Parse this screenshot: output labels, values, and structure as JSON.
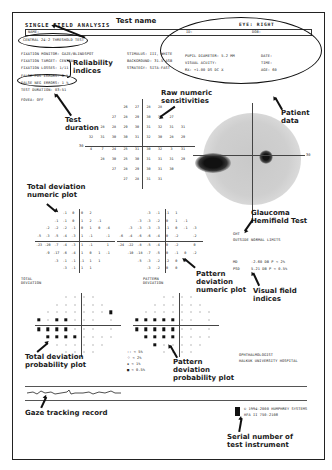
{
  "report": {
    "title": "SINGLE FIELD ANALYSIS",
    "name_label": "NAME:",
    "eye": "EYE: RIGHT",
    "id_label": "ID:",
    "dob_label": "DOB:",
    "test_name": "CENTRAL 24-2 THRESHOLD TEST",
    "left_params": [
      "FIXATION MONITOR: GAZE/BLINDSPOT",
      "FIXATION TARGET: CENTRAL",
      "FIXATION LOSSES: 1/11",
      "FALSE POS ERRORS: 0 %",
      "FALSE NEG ERRORS: 1 %",
      "TEST DURATION: 03:51",
      "FOVEA: OFF"
    ],
    "mid_params": [
      "STIMULUS: III, WHITE",
      "BACKGROUND: 31.5 ASB",
      "STRATEGY: SITA-FAST"
    ],
    "right_params": [
      "PUPIL DIAMETER: 5.2 MM",
      "VISUAL ACUITY:",
      "RX: +1.00 DS   DC X"
    ],
    "right_params2": [
      "DATE:",
      "TIME:",
      "AGE: 60"
    ],
    "ght_title": "GHT",
    "ght_value": "OUTSIDE NORMAL LIMITS",
    "md_label": "MD",
    "md_value": "-2.60 DB  P < 2%",
    "psd_label": "PSD",
    "psd_value": "5.21 DB  P < 0.5%",
    "total_dev_title": [
      "TOTAL",
      "DEVIATION"
    ],
    "pattern_dev_title": [
      "PATTERN",
      "DEVIATION"
    ],
    "legend": [
      {
        "symbol": "::",
        "text": "< 5%"
      },
      {
        "symbol": "⁘",
        "text": "< 2%"
      },
      {
        "symbol": "▪",
        "text": "< 1%"
      },
      {
        "symbol": "■",
        "text": "< 0.5%"
      }
    ],
    "physician": "OPHTHALMOLOGIST",
    "hospital": "HALKUK UNIVERSITY HOSPITAL",
    "instrument_line1": "© 1994-2000 HUMPHREY SYSTEMS",
    "instrument_line2": "HFA II 750-2108",
    "threshold_30_label": "30",
    "greyscale_30_label": "30"
  },
  "raw_sensitivities": [
    [
      "",
      "",
      "",
      "26",
      "27",
      "28",
      "28",
      "",
      "",
      ""
    ],
    [
      "",
      "",
      "27",
      "28",
      "29",
      "30",
      "30",
      "27",
      "",
      ""
    ],
    [
      "",
      "28",
      "28",
      "29",
      "30",
      "31",
      "32",
      "31",
      "31",
      ""
    ],
    [
      "32",
      "31",
      "30",
      "30",
      "31",
      "32",
      "30",
      "28",
      "29",
      ""
    ],
    [
      "4",
      "7",
      "24",
      "25",
      "31",
      "30",
      "32",
      "3",
      "31",
      ""
    ],
    [
      "",
      "28",
      "30",
      "25",
      "30",
      "31",
      "31",
      "31",
      "29",
      ""
    ],
    [
      "",
      "",
      "27",
      "28",
      "29",
      "30",
      "31",
      "30",
      "",
      ""
    ],
    [
      "",
      "",
      "",
      "27",
      "28",
      "31",
      "31",
      "",
      "",
      ""
    ]
  ],
  "total_deviation": [
    [
      "",
      "",
      "",
      "-1",
      "0",
      "0",
      "2",
      "",
      "",
      ""
    ],
    [
      "",
      "",
      "-1",
      "-1",
      "0",
      "1",
      "2",
      "-1",
      "",
      ""
    ],
    [
      "",
      "-2",
      "-2",
      "-2",
      "-1",
      "0",
      "1",
      "0",
      "-4",
      ""
    ],
    [
      "-5",
      "-3",
      "-5",
      "-4",
      "-3",
      "1",
      "-1",
      "",
      "-1",
      ""
    ],
    [
      "-23",
      "-20",
      "-7",
      "-4",
      "-3",
      "1",
      "-1",
      "",
      "1",
      ""
    ],
    [
      "",
      "-9",
      "-17",
      "-6",
      "-4",
      "1",
      "0",
      "1",
      "-1",
      ""
    ],
    [
      "",
      "",
      "-3",
      "-1",
      "-1",
      "-1",
      "1",
      "1",
      "",
      ""
    ],
    [
      "",
      "",
      "",
      "-3",
      "-1",
      "1",
      "1",
      "",
      "",
      ""
    ]
  ],
  "pattern_deviation": [
    [
      "",
      "",
      "",
      "-3",
      "-1",
      "-1",
      "1",
      "",
      "",
      ""
    ],
    [
      "",
      "",
      "-3",
      "-3",
      "-2",
      "0",
      "1",
      "-1",
      "",
      ""
    ],
    [
      "",
      "-3",
      "-3",
      "-3",
      "-3",
      "-1",
      "0",
      "-1",
      "-3",
      ""
    ],
    [
      "-6",
      "-4",
      "-6",
      "-6",
      "-4",
      "0",
      "-2",
      "",
      "-2",
      ""
    ],
    [
      "-24",
      "-22",
      "-8",
      "-5",
      "-4",
      "0",
      "-2",
      "",
      "0",
      ""
    ],
    [
      "",
      "-10",
      "-18",
      "-7",
      "-5",
      "0",
      "-1",
      "0",
      "-2",
      ""
    ],
    [
      "",
      "",
      "-5",
      "-3",
      "-2",
      "-2",
      "0",
      "1",
      "",
      ""
    ],
    [
      "",
      "",
      "",
      "-3",
      "-2",
      "0",
      "0",
      "",
      "",
      ""
    ]
  ],
  "annotations": {
    "test_name": "Test name",
    "reliability": [
      "Reliability",
      "indices"
    ],
    "test_duration": [
      "Test",
      "duration"
    ],
    "raw_numeric": [
      "Raw numeric",
      "sensitivities"
    ],
    "patient_data": [
      "Patient",
      "data"
    ],
    "total_dev_numeric": [
      "Total deviation",
      "numeric plot"
    ],
    "ght": [
      "Glaucoma",
      "Hemifield Test"
    ],
    "pattern_dev_numeric": [
      "Pattern",
      "deviation",
      "numeric plot"
    ],
    "visual_field_indices": [
      "Visual field",
      "indices"
    ],
    "total_dev_prob": [
      "Total deviation",
      "probability plot"
    ],
    "pattern_dev_prob": [
      "Pattern",
      "deviation",
      "probability plot"
    ],
    "gaze_tracking": "Gaze tracking record",
    "serial_number": [
      "Serial number of",
      "test instrument"
    ]
  }
}
